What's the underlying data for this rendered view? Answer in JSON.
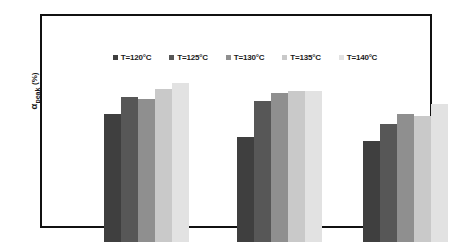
{
  "chart_data": {
    "type": "bar",
    "title": "",
    "subtitle": "",
    "xlabel": "",
    "ylabel": "α_peak (%)",
    "ylabel_parts": {
      "symbol": "α",
      "subscript": "peak",
      "unit": "(%)"
    },
    "categories": [
      "Group 1",
      "Group 2",
      "Group 3"
    ],
    "category_tick_labels": [
      "",
      "",
      ""
    ],
    "y_tick_labels": [],
    "grid": false,
    "legend_position": "top-center",
    "axis_note": "no numeric tick labels rendered on either axis",
    "series": [
      {
        "name": "T=120°C",
        "color": "#3f3f3f",
        "values": [
          61,
          50,
          48
        ]
      },
      {
        "name": "T=125°C",
        "color": "#575757",
        "values": [
          69,
          67,
          56
        ]
      },
      {
        "name": "T=130°C",
        "color": "#8f8f8f",
        "values": [
          68,
          71,
          61
        ]
      },
      {
        "name": "T=135°C",
        "color": "#c9c9c9",
        "values": [
          73,
          72,
          60
        ]
      },
      {
        "name": "T=140°C",
        "color": "#e2e2e2",
        "values": [
          76,
          72,
          66
        ]
      }
    ]
  },
  "legend": {
    "items": [
      {
        "label": "T=120°C",
        "swatch_color": "#3f3f3f"
      },
      {
        "label": "T=125°C",
        "swatch_color": "#575757"
      },
      {
        "label": "T=130°C",
        "swatch_color": "#8f8f8f"
      },
      {
        "label": "T=135°C",
        "swatch_color": "#c9c9c9"
      },
      {
        "label": "T=140°C",
        "swatch_color": "#e2e2e2"
      }
    ]
  },
  "colors": {
    "frame": "#111111",
    "background": "#ffffff",
    "text": "#1b1b1b"
  }
}
